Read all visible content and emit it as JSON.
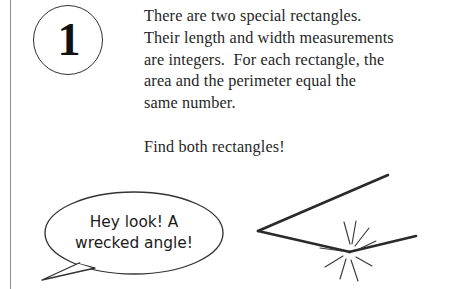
{
  "page": {
    "width": 475,
    "height": 289,
    "background": "#ffffff",
    "ink_color": "#262626"
  },
  "badge": {
    "number": "1"
  },
  "problem": {
    "lines": [
      "There are two special rectangles.",
      "Their length and width measurements",
      "are integers.  For each rectangle, the",
      "area and the perimeter equal the",
      "same number."
    ],
    "call_to_action": "Find both rectangles!"
  },
  "cartoon": {
    "speech_bubble": {
      "lines": [
        "Hey look! A",
        "wrecked angle!"
      ]
    },
    "wrecked_angle": {
      "vertex": [
        258,
        231
      ],
      "upper_ray_end": [
        388,
        175
      ],
      "lower_ray_end": [
        350,
        252
      ],
      "broken_segment_start": [
        350,
        252
      ],
      "broken_segment_end": [
        416,
        236
      ],
      "break_point": [
        350,
        252
      ],
      "burst_spokes": 9
    }
  }
}
